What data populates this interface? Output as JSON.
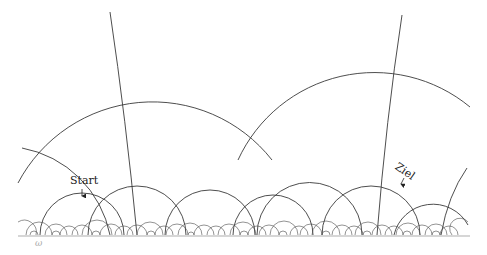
{
  "diagram": {
    "type": "hyperbolic-tessellation-upper-half-plane",
    "labels": {
      "start": "Start",
      "ziel": "Ziel",
      "boundary": "ω"
    },
    "colors": {
      "background": "#ffffff",
      "stroke": "#3a3a3a",
      "baseline": "#c8c8c8"
    },
    "baseline_y": 235,
    "large_arcs": [
      {
        "cx": 148,
        "r": 152
      },
      {
        "cx": 355,
        "r": 150
      }
    ],
    "geodesics": [
      {
        "from": [
          110,
          12
        ],
        "to": [
          137,
          235
        ]
      },
      {
        "from": [
          402,
          15
        ],
        "to": [
          377,
          235
        ]
      }
    ],
    "markers": [
      {
        "name": "start",
        "x": 82,
        "y": 199
      },
      {
        "name": "ziel",
        "x": 401,
        "y": 186
      }
    ]
  }
}
